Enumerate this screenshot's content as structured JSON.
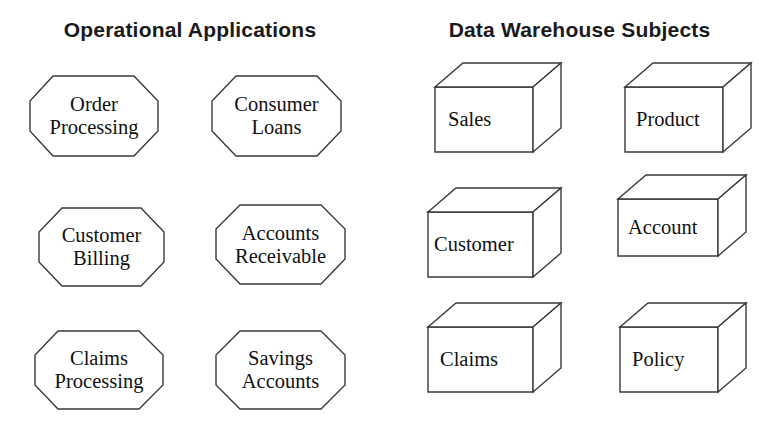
{
  "headings": {
    "left": "Operational Applications",
    "right": "Data Warehouse Subjects"
  },
  "colors": {
    "background": "#ffffff",
    "outline": "#3a3a3a",
    "heading_text": "#1a1a1a",
    "label_text": "#111111"
  },
  "operational_applications": [
    {
      "id": "order-processing",
      "line1": "Order",
      "line2": "Processing",
      "text": "Order Processing",
      "row": 1,
      "col": 1
    },
    {
      "id": "consumer-loans",
      "line1": "Consumer",
      "line2": "Loans",
      "text": "Consumer Loans",
      "row": 1,
      "col": 2
    },
    {
      "id": "customer-billing",
      "line1": "Customer",
      "line2": "Billing",
      "text": "Customer Billing",
      "row": 2,
      "col": 1
    },
    {
      "id": "accounts-receivable",
      "line1": "Accounts",
      "line2": "Receivable",
      "text": "Accounts Receivable",
      "row": 2,
      "col": 2
    },
    {
      "id": "claims-processing",
      "line1": "Claims",
      "line2": "Processing",
      "text": "Claims Processing",
      "row": 3,
      "col": 1
    },
    {
      "id": "savings-accounts",
      "line1": "Savings",
      "line2": "Accounts",
      "text": "Savings Accounts",
      "row": 3,
      "col": 2
    }
  ],
  "data_warehouse_subjects": [
    {
      "id": "sales",
      "text": "Sales",
      "row": 1,
      "col": 1
    },
    {
      "id": "product",
      "text": "Product",
      "row": 1,
      "col": 2
    },
    {
      "id": "customer",
      "text": "Customer",
      "row": 2,
      "col": 1
    },
    {
      "id": "account",
      "text": "Account",
      "row": 2,
      "col": 2
    },
    {
      "id": "claims",
      "text": "Claims",
      "row": 3,
      "col": 1
    },
    {
      "id": "policy",
      "text": "Policy",
      "row": 3,
      "col": 2
    }
  ],
  "shape_kinds": {
    "operational": "octagon",
    "warehouse": "3d-cube"
  }
}
